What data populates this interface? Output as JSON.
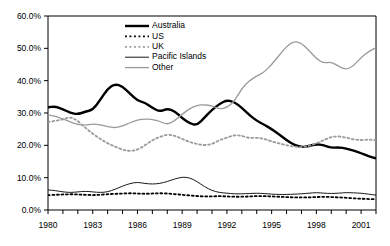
{
  "chart_data": {
    "type": "line",
    "title": "",
    "subtitle": "",
    "xlabel": "",
    "ylabel": "",
    "xlim": [
      1980,
      2002
    ],
    "ylim": [
      0,
      0.6
    ],
    "y_tick_labels": [
      "0.0%",
      "10.0%",
      "20.0%",
      "30.0%",
      "40.0%",
      "50.0%",
      "60.0%"
    ],
    "y_tick_values": [
      0,
      10,
      20,
      30,
      40,
      50,
      60
    ],
    "x_tick_labels": [
      "1980",
      "1983",
      "1986",
      "1989",
      "1992",
      "1995",
      "1998",
      "2001"
    ],
    "x_tick_values": [
      1980,
      1983,
      1986,
      1989,
      1992,
      1995,
      1998,
      2001
    ],
    "x_minor_tick_step": 1,
    "grid": false,
    "legend_position": "top-center",
    "value_unit": "percent",
    "x": [
      1980,
      1980.5,
      1981,
      1981.5,
      1982,
      1982.5,
      1983,
      1983.5,
      1984,
      1984.5,
      1985,
      1985.5,
      1986,
      1986.5,
      1987,
      1987.5,
      1988,
      1988.5,
      1989,
      1989.5,
      1990,
      1990.5,
      1991,
      1991.5,
      1992,
      1992.5,
      1993,
      1993.5,
      1994,
      1994.5,
      1995,
      1995.5,
      1996,
      1996.5,
      1997,
      1997.5,
      1998,
      1998.5,
      1999,
      1999.5,
      2000,
      2000.5,
      2001,
      2001.5,
      2002
    ],
    "series": [
      {
        "name": "Australia",
        "style": "solid",
        "color": "#000000",
        "width": 2.4,
        "values": [
          31.8,
          32.0,
          31.2,
          30.0,
          29.6,
          30.4,
          31.0,
          34.0,
          37.5,
          39.0,
          38.2,
          36.0,
          33.8,
          33.2,
          31.6,
          30.4,
          31.4,
          30.6,
          28.4,
          26.8,
          26.2,
          28.6,
          31.0,
          32.8,
          34.0,
          33.4,
          31.6,
          29.4,
          27.6,
          26.4,
          25.0,
          23.4,
          21.6,
          20.2,
          19.4,
          19.8,
          20.4,
          20.0,
          19.2,
          19.4,
          19.0,
          18.4,
          17.6,
          16.6,
          16.0
        ]
      },
      {
        "name": "US",
        "style": "dotted",
        "color": "#000000",
        "width": 1.8,
        "values": [
          4.6,
          4.7,
          4.8,
          4.9,
          4.8,
          4.7,
          4.6,
          4.7,
          4.9,
          5.0,
          5.1,
          5.2,
          5.1,
          5.0,
          5.1,
          5.2,
          5.1,
          4.9,
          4.7,
          4.5,
          4.3,
          4.2,
          4.2,
          4.3,
          4.2,
          4.1,
          4.1,
          4.2,
          4.3,
          4.3,
          4.2,
          4.1,
          4.0,
          3.9,
          3.9,
          3.9,
          4.0,
          4.1,
          4.0,
          3.9,
          3.8,
          3.6,
          3.5,
          3.4,
          3.3
        ]
      },
      {
        "name": "UK",
        "style": "dotted",
        "color": "#9a9a9a",
        "width": 1.8,
        "values": [
          27.2,
          27.6,
          28.0,
          28.8,
          27.6,
          25.4,
          23.6,
          22.0,
          20.6,
          19.6,
          18.6,
          18.2,
          18.6,
          20.0,
          21.6,
          22.6,
          23.4,
          23.0,
          22.0,
          21.0,
          20.4,
          20.0,
          20.4,
          21.6,
          22.4,
          23.2,
          23.0,
          22.2,
          22.4,
          22.0,
          21.2,
          20.6,
          20.0,
          19.6,
          19.4,
          19.8,
          20.6,
          21.6,
          22.6,
          22.8,
          22.4,
          21.8,
          21.6,
          21.8,
          21.6
        ]
      },
      {
        "name": "Pacific Islands",
        "style": "solid",
        "color": "#000000",
        "width": 0.9,
        "values": [
          6.2,
          6.0,
          5.6,
          5.4,
          5.6,
          5.8,
          5.6,
          5.4,
          5.6,
          6.4,
          7.4,
          8.2,
          8.6,
          8.2,
          8.0,
          8.2,
          8.8,
          9.6,
          10.2,
          10.0,
          8.8,
          7.2,
          6.0,
          5.4,
          5.2,
          5.0,
          5.0,
          5.1,
          5.2,
          5.1,
          4.9,
          4.8,
          4.8,
          4.9,
          5.0,
          5.2,
          5.4,
          5.2,
          5.1,
          5.2,
          5.4,
          5.3,
          5.2,
          4.9,
          4.6
        ]
      },
      {
        "name": "Other",
        "style": "solid",
        "color": "#9a9a9a",
        "width": 1.3,
        "values": [
          29.4,
          29.0,
          28.2,
          27.2,
          26.4,
          26.2,
          26.6,
          26.4,
          25.8,
          25.4,
          26.0,
          27.0,
          27.8,
          28.2,
          28.0,
          27.4,
          26.4,
          27.6,
          29.6,
          31.4,
          32.4,
          32.6,
          32.2,
          31.2,
          31.6,
          33.6,
          37.6,
          40.0,
          41.4,
          42.6,
          45.0,
          47.8,
          50.6,
          52.2,
          51.6,
          49.4,
          46.8,
          45.4,
          45.8,
          44.4,
          43.4,
          44.6,
          47.2,
          49.0,
          50.2
        ]
      }
    ]
  },
  "legend": {
    "items": [
      {
        "label": "Australia"
      },
      {
        "label": "US"
      },
      {
        "label": "UK"
      },
      {
        "label": "Pacific Islands"
      },
      {
        "label": "Other"
      }
    ]
  }
}
